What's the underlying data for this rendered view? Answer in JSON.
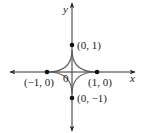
{
  "diagram": {
    "type": "astroid-on-axes",
    "axes": {
      "x_label": "x",
      "y_label": "y",
      "origin_label": "0"
    },
    "points": [
      {
        "label": "(0, 1)",
        "x": 0,
        "y": 1
      },
      {
        "label": "(0, −1)",
        "x": 0,
        "y": -1
      },
      {
        "label": "(−1, 0)",
        "x": -1,
        "y": 0
      },
      {
        "label": "(1, 0)",
        "x": 1,
        "y": 0
      }
    ],
    "colors": {
      "axis": "#333333",
      "curve": "#555555",
      "point": "#111111",
      "background": "#ffffff"
    }
  }
}
